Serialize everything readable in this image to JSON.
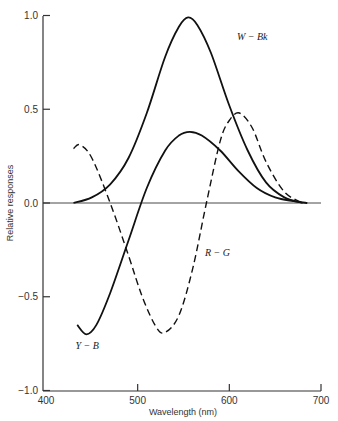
{
  "chart_data": {
    "type": "line",
    "title": "",
    "xlabel": "Wavelength  (nm)",
    "ylabel": "Relative responses",
    "xlim": [
      400,
      700
    ],
    "ylim": [
      -1.0,
      1.0
    ],
    "x_ticks": [
      400,
      500,
      600,
      700
    ],
    "x_tick_labels": [
      "400",
      "500",
      "600",
      "700"
    ],
    "y_ticks": [
      1.0,
      0.5,
      0.0,
      -0.5,
      -1.0
    ],
    "y_tick_labels": [
      "1.0",
      "0.5",
      "0.0",
      "−0.5",
      "−1.0"
    ],
    "grid": false,
    "legend": "inline labels",
    "series": [
      {
        "name": "W − Bk",
        "style": "solid",
        "x": [
          430,
          450,
          470,
          490,
          510,
          530,
          545,
          555,
          565,
          580,
          600,
          620,
          640,
          660,
          680
        ],
        "values": [
          0.0,
          0.03,
          0.1,
          0.24,
          0.48,
          0.78,
          0.94,
          0.99,
          0.95,
          0.8,
          0.52,
          0.28,
          0.11,
          0.03,
          0.0
        ]
      },
      {
        "name": "Y − B",
        "style": "solid",
        "x": [
          434,
          444,
          455,
          470,
          490,
          510,
          530,
          545,
          557,
          570,
          590,
          610,
          630,
          650,
          670,
          685
        ],
        "values": [
          -0.65,
          -0.7,
          -0.65,
          -0.48,
          -0.2,
          0.08,
          0.28,
          0.36,
          0.38,
          0.36,
          0.28,
          0.17,
          0.08,
          0.03,
          0.01,
          0.0
        ]
      },
      {
        "name": "R − G",
        "style": "dashed",
        "x": [
          430,
          437,
          450,
          470,
          490,
          505,
          520,
          530,
          545,
          560,
          575,
          590,
          600,
          611,
          625,
          640,
          660,
          680
        ],
        "values": [
          0.29,
          0.31,
          0.24,
          0.0,
          -0.28,
          -0.5,
          -0.66,
          -0.69,
          -0.6,
          -0.35,
          0.0,
          0.33,
          0.44,
          0.48,
          0.4,
          0.22,
          0.06,
          0.0
        ]
      }
    ],
    "annotations": [
      {
        "text": "W − Bk",
        "x": 625,
        "y": 0.87
      },
      {
        "text": "R − G",
        "x": 587,
        "y": -0.28
      },
      {
        "text": "Y − B",
        "x": 445,
        "y": -0.78
      }
    ]
  }
}
